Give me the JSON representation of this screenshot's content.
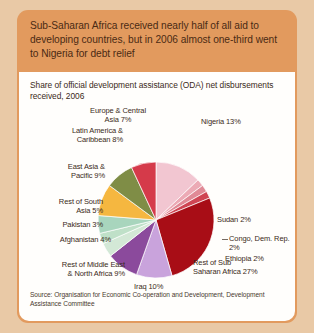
{
  "headline": "Sub-Saharan Africa received nearly half of all aid to developing countries, but in 2006 almost one-third went to Nigeria for debt relief",
  "source": "Source: Organisation for Economic Co-operation and Development, Development Assistance Committee",
  "colors": {
    "page_background": "#e9c9a6",
    "banner": "#e29a5e",
    "banner_text": "#4a2a14",
    "card": "#fffefc",
    "label_text": "#3b2a20"
  },
  "chart_data": {
    "type": "pie",
    "title": "Share of official development assistance (ODA) net disbursements received, 2006",
    "xlabel": "",
    "ylabel": "",
    "legend_position": "none",
    "grid": false,
    "start_angle_deg": 0,
    "direction": "clockwise",
    "categories": [
      "Nigeria",
      "Sudan",
      "Congo, Dem. Rep.",
      "Ethiopia",
      "Rest of Sub Saharan Africa",
      "Iraq",
      "Rest of Middle East & North Africa",
      "Afghanistan",
      "Pakistan",
      "Rest of South Asia",
      "East Asia & Pacific",
      "Latin America & Caribbean",
      "Europe & Central Asia"
    ],
    "values": [
      13,
      2,
      2,
      2,
      27,
      10,
      9,
      4,
      3,
      5,
      9,
      8,
      7
    ],
    "slice_colors": [
      "#f2c6d1",
      "#ecaab5",
      "#e08a96",
      "#cf4553",
      "#a80d16",
      "#c9a3dc",
      "#8b4a9c",
      "#d3e8d6",
      "#bfe0c8",
      "#a8d5bd",
      "#f5b740",
      "#7f8d46",
      "#d53a4a"
    ],
    "labels": [
      {
        "key": "nigeria",
        "text": "Nigeria 13%"
      },
      {
        "key": "sudan",
        "text": "Sudan 2%"
      },
      {
        "key": "congo",
        "text": "Congo, Dem. Rep.\n2%"
      },
      {
        "key": "ethiopia",
        "text": "Ethiopia 2%"
      },
      {
        "key": "rest_ssa",
        "text": "Rest of Sub\nSaharan Africa 27%"
      },
      {
        "key": "iraq",
        "text": "Iraq 10%"
      },
      {
        "key": "rest_mena",
        "text": "Rest of Middle East\n& North Africa 9%"
      },
      {
        "key": "afghanistan",
        "text": "Afghanistan 4%"
      },
      {
        "key": "pakistan",
        "text": "Pakistan 3%"
      },
      {
        "key": "rest_sa",
        "text": "Rest of South\nAsia 5%"
      },
      {
        "key": "east_asia",
        "text": "East Asia &\nPacific 9%"
      },
      {
        "key": "latin_america",
        "text": "Latin America &\nCaribbean 8%"
      },
      {
        "key": "europe_ca",
        "text": "Europe & Central\nAsia 7%"
      }
    ]
  }
}
